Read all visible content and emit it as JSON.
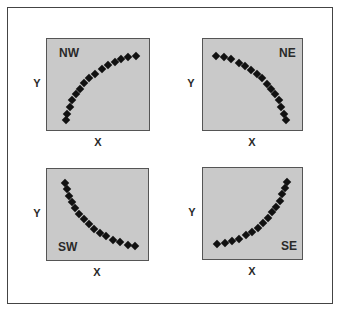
{
  "chart_data": [
    {
      "type": "scatter",
      "title": "NW",
      "xlabel": "X",
      "ylabel": "Y",
      "description": "concave-down increasing curve",
      "points": [
        [
          19,
          81
        ],
        [
          20,
          75
        ],
        [
          23,
          68
        ],
        [
          25,
          61
        ],
        [
          29,
          55
        ],
        [
          33,
          50
        ],
        [
          37,
          44
        ],
        [
          42,
          39
        ],
        [
          48,
          35
        ],
        [
          55,
          30
        ],
        [
          61,
          26
        ],
        [
          68,
          23
        ],
        [
          74,
          20
        ],
        [
          81,
          18
        ],
        [
          89,
          17
        ]
      ]
    },
    {
      "type": "scatter",
      "title": "NE",
      "xlabel": "X",
      "ylabel": "Y",
      "description": "concave-down decreasing curve",
      "points": [
        [
          13,
          17
        ],
        [
          21,
          18
        ],
        [
          28,
          20
        ],
        [
          36,
          24
        ],
        [
          42,
          27
        ],
        [
          48,
          31
        ],
        [
          54,
          35
        ],
        [
          59,
          39
        ],
        [
          64,
          45
        ],
        [
          68,
          50
        ],
        [
          72,
          55
        ],
        [
          76,
          61
        ],
        [
          78,
          68
        ],
        [
          81,
          75
        ],
        [
          83,
          81
        ]
      ]
    },
    {
      "type": "scatter",
      "title": "SW",
      "xlabel": "X",
      "ylabel": "Y",
      "description": "concave-up decreasing curve",
      "points": [
        [
          18,
          14
        ],
        [
          20,
          20
        ],
        [
          22,
          27
        ],
        [
          25,
          33
        ],
        [
          28,
          39
        ],
        [
          32,
          45
        ],
        [
          37,
          50
        ],
        [
          42,
          55
        ],
        [
          47,
          60
        ],
        [
          53,
          64
        ],
        [
          59,
          67
        ],
        [
          66,
          71
        ],
        [
          73,
          73
        ],
        [
          81,
          76
        ],
        [
          88,
          77
        ]
      ]
    },
    {
      "type": "scatter",
      "title": "SE",
      "xlabel": "X",
      "ylabel": "Y",
      "description": "concave-up increasing curve",
      "points": [
        [
          14,
          76
        ],
        [
          22,
          75
        ],
        [
          29,
          73
        ],
        [
          36,
          71
        ],
        [
          43,
          67
        ],
        [
          49,
          64
        ],
        [
          55,
          60
        ],
        [
          60,
          55
        ],
        [
          65,
          50
        ],
        [
          69,
          44
        ],
        [
          73,
          39
        ],
        [
          77,
          33
        ],
        [
          79,
          26
        ],
        [
          82,
          20
        ],
        [
          84,
          14
        ]
      ]
    }
  ],
  "panels": [
    {
      "id": "nw",
      "label": "NW",
      "x": 46,
      "y": 38,
      "w": 104,
      "h": 93,
      "label_pos": {
        "left": 12,
        "top": 8
      },
      "ylabel": "Y",
      "xlabel": "X",
      "ylabel_pos": [
        37,
        83
      ],
      "xlabel_pos": [
        98,
        142
      ]
    },
    {
      "id": "ne",
      "label": "NE",
      "x": 202,
      "y": 38,
      "w": 101,
      "h": 93,
      "label_pos": {
        "left": 76,
        "top": 8
      },
      "ylabel": "Y",
      "xlabel": "X",
      "ylabel_pos": [
        191,
        83
      ],
      "xlabel_pos": [
        252,
        142
      ]
    },
    {
      "id": "sw",
      "label": "SW",
      "x": 46,
      "y": 168,
      "w": 103,
      "h": 93,
      "label_pos": {
        "left": 11,
        "top": 72
      },
      "ylabel": "Y",
      "xlabel": "X",
      "ylabel_pos": [
        37,
        213
      ],
      "xlabel_pos": [
        97,
        272
      ]
    },
    {
      "id": "se",
      "label": "SE",
      "x": 202,
      "y": 167,
      "w": 101,
      "h": 93,
      "label_pos": {
        "left": 78,
        "top": 72
      },
      "ylabel": "Y",
      "xlabel": "X",
      "ylabel_pos": [
        192,
        212
      ],
      "xlabel_pos": [
        252,
        271
      ]
    }
  ]
}
